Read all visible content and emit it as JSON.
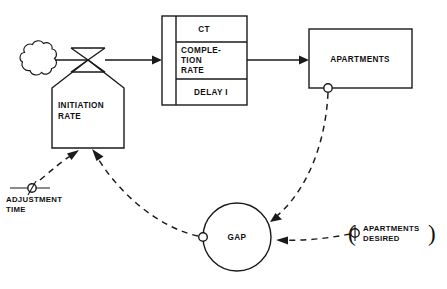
{
  "diagram": {
    "type": "system-dynamics-flow-diagram",
    "nodes": {
      "source_cloud": {
        "kind": "source-sink-cloud",
        "label": ""
      },
      "initiation_rate": {
        "kind": "rate-valve",
        "label_line1": "INITIATION",
        "label_line2": "RATE"
      },
      "delay_block": {
        "kind": "third-order-delay",
        "row1": "CT",
        "row2_line1": "COMPLE-",
        "row2_line2": "TION",
        "row2_line3": "RATE",
        "row3": "DELAY I"
      },
      "apartments": {
        "kind": "level-stock",
        "label": "APARTMENTS"
      },
      "gap": {
        "kind": "auxiliary-circle",
        "label": "GAP"
      },
      "adjustment_time": {
        "kind": "constant",
        "label_line1": "ADJUSTMENT",
        "label_line2": "TIME"
      },
      "apartments_desired": {
        "kind": "constant",
        "label_line1": "APARTMENTS",
        "label_line2": "DESIRED",
        "paren_left": "(",
        "paren_right": ")"
      }
    },
    "flows": [
      {
        "from": "source_cloud",
        "to": "initiation_rate",
        "style": "solid-material"
      },
      {
        "from": "initiation_rate",
        "to": "delay_block",
        "style": "solid-material"
      },
      {
        "from": "delay_block",
        "to": "apartments",
        "style": "solid-material"
      }
    ],
    "information_links": [
      {
        "from": "apartments",
        "to": "gap",
        "style": "dashed-information"
      },
      {
        "from": "apartments_desired",
        "to": "gap",
        "style": "dashed-information"
      },
      {
        "from": "gap",
        "to": "initiation_rate",
        "style": "dashed-information"
      },
      {
        "from": "adjustment_time",
        "to": "initiation_rate",
        "style": "dashed-information"
      }
    ],
    "colors": {
      "stroke": "#1a1a1a",
      "background": "#ffffff",
      "text": "#111111"
    }
  }
}
